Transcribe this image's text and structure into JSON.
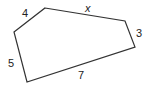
{
  "figure": {
    "type": "pentagon",
    "stroke_color": "#333333",
    "vertices": [
      [
        45,
        8
      ],
      [
        125,
        21
      ],
      [
        135,
        47
      ],
      [
        27,
        82
      ],
      [
        14,
        32
      ]
    ],
    "sides": [
      {
        "name": "top",
        "label": "x",
        "x": 85,
        "y": 12
      },
      {
        "name": "right",
        "label": "3",
        "x": 136,
        "y": 37
      },
      {
        "name": "bottom",
        "label": "7",
        "x": 78,
        "y": 79
      },
      {
        "name": "left",
        "label": "5",
        "x": 8,
        "y": 67
      },
      {
        "name": "upper-left",
        "label": "4",
        "x": 22,
        "y": 17
      }
    ]
  }
}
